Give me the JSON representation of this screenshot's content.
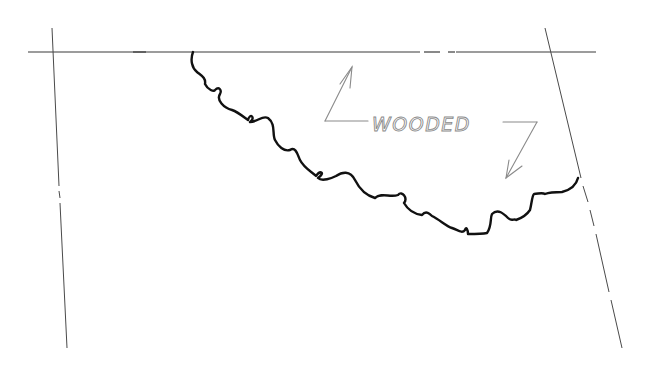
{
  "diagram": {
    "type": "site-plan-sketch",
    "annotation": {
      "label": "WOODED",
      "arrows": 2,
      "color": "#8a8a8a"
    },
    "boundary_lines": {
      "top": "property line (dash-dot)",
      "left": "property line (dash-dot)",
      "right": "property line (dash-dot)",
      "color": "#3a3a3a"
    },
    "tree_line": {
      "description": "scalloped wooded area edge",
      "color": "#111111"
    }
  }
}
